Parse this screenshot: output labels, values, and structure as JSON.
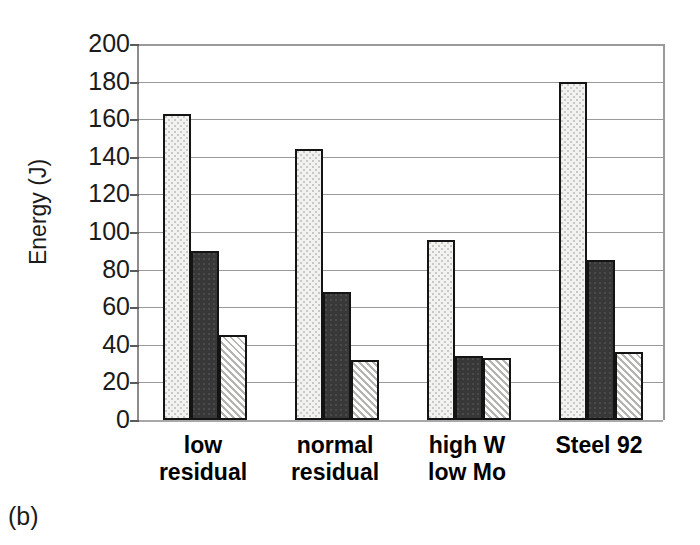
{
  "panel": {
    "caption": "(b)"
  },
  "chart_data": {
    "type": "bar",
    "title": "",
    "xlabel": "",
    "ylabel": "Energy (J)",
    "ylim": [
      0,
      200
    ],
    "ytick_step": 20,
    "ytick_labels": [
      "200",
      "180",
      "160",
      "140",
      "120",
      "100",
      "80",
      "60",
      "40",
      "20",
      "0"
    ],
    "ytick_values": [
      200,
      180,
      160,
      140,
      120,
      100,
      80,
      60,
      40,
      20,
      0
    ],
    "grid": true,
    "legend": "none",
    "categories": [
      "low\nresidual",
      "normal\nresidual",
      "high W\nlow Mo",
      "Steel 92"
    ],
    "series": [
      {
        "name": "series-1",
        "fill": "light-dotted",
        "values": [
          163,
          144,
          96,
          180
        ]
      },
      {
        "name": "series-2",
        "fill": "dark-solid",
        "values": [
          90,
          68,
          34,
          85
        ]
      },
      {
        "name": "series-3",
        "fill": "diagonal-hatched",
        "values": [
          45,
          32,
          33,
          36
        ]
      }
    ]
  },
  "colors": {
    "series_light": "#f2f2f0",
    "series_dark": "#383838",
    "series_hatch": "#e9e9e7",
    "gridline": "#9a9a9a",
    "bar_outline": "#141414",
    "text": "#1b1b1b"
  }
}
